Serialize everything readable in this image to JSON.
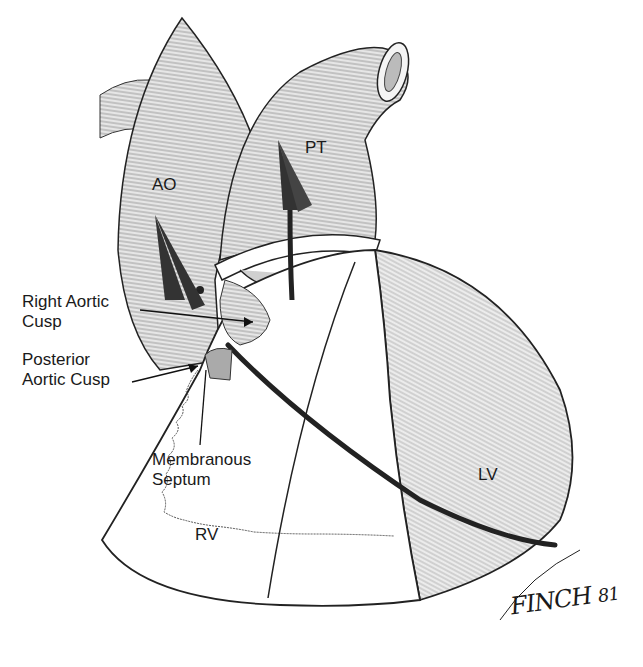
{
  "figure": {
    "colors": {
      "ink": "#1a1a1a",
      "shade": "#9a9a9a",
      "background": "#ffffff"
    }
  },
  "labels": {
    "ao": "AO",
    "pt": "PT",
    "right_aortic_cusp_line1": "Right Aortic",
    "right_aortic_cusp_line2": "Cusp",
    "posterior_aortic_cusp_line1": "Posterior",
    "posterior_aortic_cusp_line2": "Aortic Cusp",
    "membranous_septum_line1": "Membranous",
    "membranous_septum_line2": "Septum",
    "rv": "RV",
    "lv": "LV"
  },
  "signature": {
    "name": "FINCH",
    "year": "81"
  }
}
